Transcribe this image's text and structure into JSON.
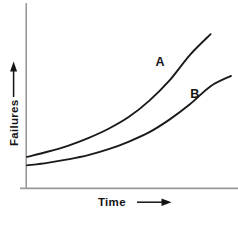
{
  "chart_data": {
    "type": "line",
    "title": "",
    "xlabel": "Time",
    "ylabel": "Failures",
    "xlabel_arrow": "right-arrow",
    "ylabel_arrow": "up-arrow",
    "grid": false,
    "axis_ticks": false,
    "legend": "inline-curve-labels",
    "xlim": [
      0,
      10
    ],
    "ylim": [
      0,
      10
    ],
    "series": [
      {
        "name": "A",
        "label": "A",
        "color": "#1a1a1a",
        "x": [
          0,
          1,
          2,
          3,
          4,
          5,
          6,
          7,
          8,
          9
        ],
        "y": [
          1.85,
          2.15,
          2.5,
          2.95,
          3.5,
          4.2,
          5.15,
          6.35,
          7.85,
          9.05
        ]
      },
      {
        "name": "B",
        "label": "B",
        "color": "#1a1a1a",
        "x": [
          0,
          1,
          2,
          3,
          4,
          5,
          6,
          7,
          8,
          9,
          10
        ],
        "y": [
          1.35,
          1.5,
          1.7,
          1.95,
          2.3,
          2.75,
          3.3,
          4.05,
          4.95,
          6.0,
          6.6
        ]
      }
    ],
    "annotations": [
      {
        "text": "A",
        "x": 6.3,
        "y": 7.2
      },
      {
        "text": "B",
        "x": 8.0,
        "y": 5.3
      }
    ],
    "colors": {
      "background": "#ffffff",
      "axis": "#9a9a9a",
      "curve": "#1a1a1a",
      "text": "#141414"
    }
  }
}
